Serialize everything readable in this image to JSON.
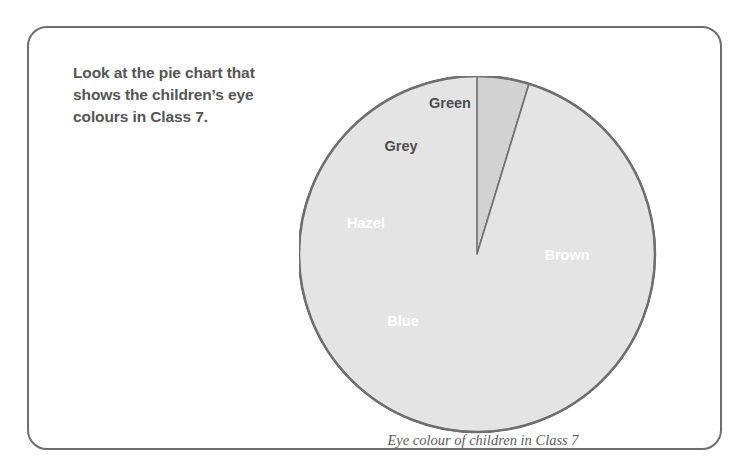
{
  "card": {
    "border_color": "#6e6e6e"
  },
  "prompt": {
    "line1": "Look at the pie chart that",
    "line2": "shows the children’s eye",
    "line3": "colours in Class 7.",
    "color": "#555555"
  },
  "caption": {
    "text": "Eye colour of children in Class 7",
    "color": "#5b5b5b"
  },
  "chart_data": {
    "type": "pie",
    "title": "Eye colour of children in Class 7",
    "xlabel": "",
    "ylabel": "",
    "legend": "none",
    "labels_on_slices": true,
    "start_angle_deg": 0,
    "direction": "clockwise",
    "categories": [
      "Brown",
      "Blue",
      "Hazel",
      "Grey",
      "Green"
    ],
    "values": [
      50,
      34,
      11,
      9.7,
      4.7
    ],
    "units": "percent",
    "slices": [
      {
        "label": "Brown",
        "percent": 50,
        "start_deg": 0,
        "end_deg": 180,
        "color": "#4d4d4d",
        "label_color": "#ffffff",
        "label_x": 545,
        "label_y": 237
      },
      {
        "label": "Blue",
        "percent": 34,
        "start_deg": 180,
        "end_deg": 302,
        "color": "#939393",
        "label_color": "#ffffff",
        "label_x": 381,
        "label_y": 303
      },
      {
        "label": "Hazel",
        "percent": 11,
        "start_deg": 302,
        "end_deg": 342,
        "color": "#a8a8a8",
        "label_color": "#ffffff",
        "label_x": 344,
        "label_y": 205
      },
      {
        "label": "Grey",
        "percent": 9.7,
        "start_deg": 342,
        "end_deg": 377,
        "color": "#d2d2d2",
        "label_color": "#4d4d4d",
        "label_x": 379,
        "label_y": 128
      },
      {
        "label": "Green",
        "percent": 4.7,
        "start_deg": 377,
        "end_deg": 360,
        "color": "#e4e4e4",
        "label_color": "#4d4d4d",
        "label_x": 428,
        "label_y": 85
      }
    ],
    "geometry": {
      "center_x": 455,
      "center_y": 231,
      "radius": 178,
      "outline_color": "#6f6f6f"
    }
  }
}
